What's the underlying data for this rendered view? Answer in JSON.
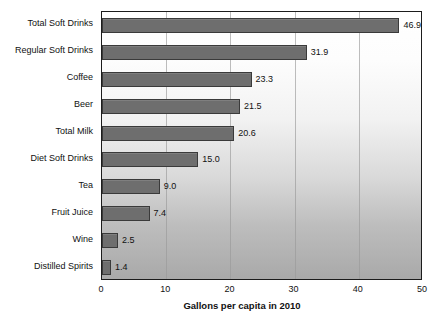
{
  "chart_data": {
    "type": "bar",
    "orientation": "horizontal",
    "title": "",
    "xlabel": "Gallons per capita in 2010",
    "ylabel": "",
    "xlim": [
      0,
      50
    ],
    "xticks": [
      0,
      10,
      20,
      30,
      40,
      50
    ],
    "grid": true,
    "legend": false,
    "categories": [
      "Total Soft Drinks",
      "Regular Soft Drinks",
      "Coffee",
      "Beer",
      "Total Milk",
      "Diet Soft Drinks",
      "Tea",
      "Fruit Juice",
      "Wine",
      "Distilled Spirits"
    ],
    "values": [
      46.9,
      31.9,
      23.3,
      21.5,
      20.6,
      15.0,
      9.0,
      7.4,
      2.5,
      1.4
    ],
    "value_labels": [
      "46.9",
      "31.9",
      "23.3",
      "21.5",
      "20.6",
      "15.0",
      "9.0",
      "7.4",
      "2.5",
      "1.4"
    ],
    "bar_color": "#6e6e6e",
    "bar_border_color": "#3a3a3a",
    "plot_border_color": "#1c1c1c",
    "gridline_color": "#9a9a9a",
    "background_gradient_top": "#ffffff",
    "background_gradient_bottom": "#a9a9a9",
    "text_color": "#111111"
  }
}
